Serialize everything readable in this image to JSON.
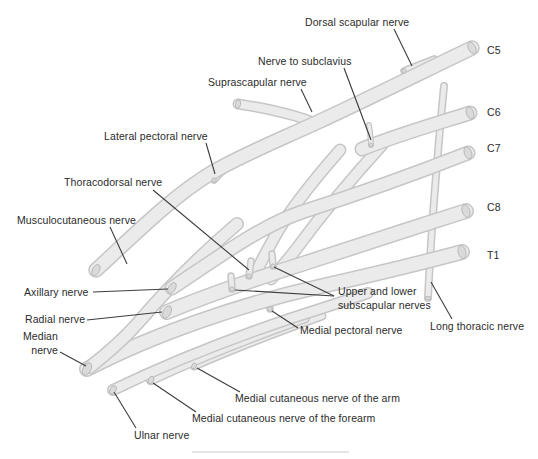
{
  "labels": {
    "dorsal_scapular": "Dorsal scapular nerve",
    "nerve_to_subclavius": "Nerve to subclavius",
    "suprascapular": "Suprascapular nerve",
    "lateral_pectoral": "Lateral pectoral nerve",
    "thoracodorsal": "Thoracodorsal nerve",
    "musculocutaneous": "Musculocutaneous nerve",
    "axillary": "Axillary nerve",
    "radial": "Radial nerve",
    "median": "Median\nnerve",
    "ulnar": "Ulnar nerve",
    "medial_cutaneous_forearm": "Medial cutaneous nerve of the forearm",
    "medial_cutaneous_arm": "Medial cutaneous nerve of the arm",
    "medial_pectoral": "Medial pectoral nerve",
    "subscapular": "Upper and lower\nsubscapular nerves",
    "long_thoracic": "Long thoracic nerve"
  },
  "roots": {
    "c5": "C5",
    "c6": "C6",
    "c7": "C7",
    "c8": "C8",
    "t1": "T1"
  },
  "colors": {
    "background": "#ffffff",
    "nerve_fill": "#ebebeb",
    "nerve_outline": "#c6c6c6",
    "pointer_line": "#3d3d3d",
    "label_text": "#2b2b2b"
  }
}
